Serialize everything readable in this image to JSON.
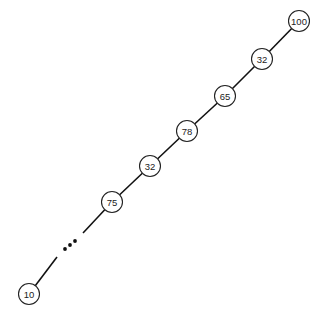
{
  "diagram": {
    "type": "degenerate-binary-tree",
    "nodes": [
      {
        "id": "n1",
        "label": "100",
        "x": 299,
        "y": 21
      },
      {
        "id": "n2",
        "label": "32",
        "x": 262,
        "y": 59
      },
      {
        "id": "n3",
        "label": "65",
        "x": 225,
        "y": 96
      },
      {
        "id": "n4",
        "label": "78",
        "x": 187,
        "y": 131
      },
      {
        "id": "n5",
        "label": "32",
        "x": 150,
        "y": 166
      },
      {
        "id": "n6",
        "label": "75",
        "x": 112,
        "y": 202
      },
      {
        "id": "n7",
        "label": "10",
        "x": 29,
        "y": 294
      }
    ],
    "ellipsis": "..."
  }
}
